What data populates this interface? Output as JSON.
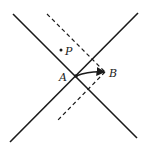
{
  "diagram": {
    "labels": {
      "A": "A",
      "B": "B",
      "P": "P"
    },
    "colors": {
      "line": "#1a1a1a",
      "background": "#ffffff"
    },
    "elements": {
      "solid_line_1": {
        "x1": 13,
        "y1": 14,
        "x2": 137,
        "y2": 138
      },
      "solid_line_2": {
        "x1": 138,
        "y1": 13,
        "x2": 10,
        "y2": 142
      },
      "dashed_line_upper": {
        "x1": 47,
        "y1": 14,
        "x2": 105,
        "y2": 72
      },
      "dashed_line_lower": {
        "x1": 105,
        "y1": 72,
        "x2": 56,
        "y2": 122
      },
      "arrow_AB": {
        "x1": 76,
        "y1": 76,
        "x2": 104,
        "y2": 72
      },
      "point_P": {
        "cx": 61,
        "cy": 50
      }
    }
  }
}
